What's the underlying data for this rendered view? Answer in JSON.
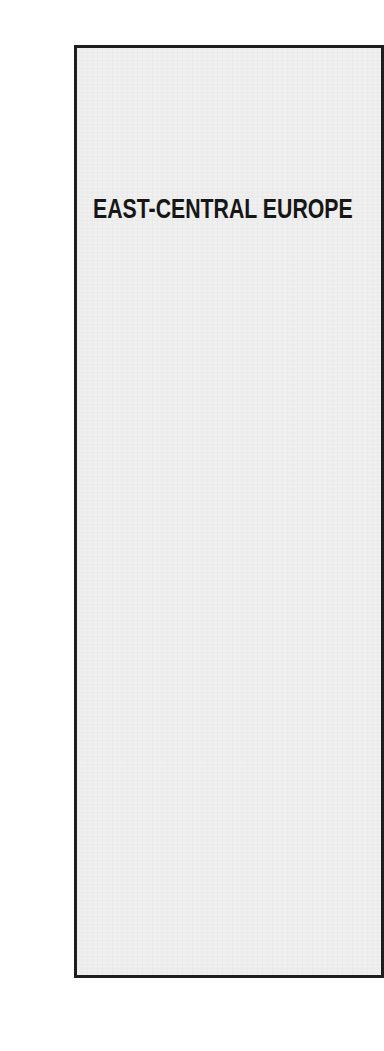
{
  "page": {
    "panel": {
      "title": "EAST-CENTRAL EUROPE",
      "background_color": "#ededed",
      "border_color": "#1e1e1e"
    }
  }
}
